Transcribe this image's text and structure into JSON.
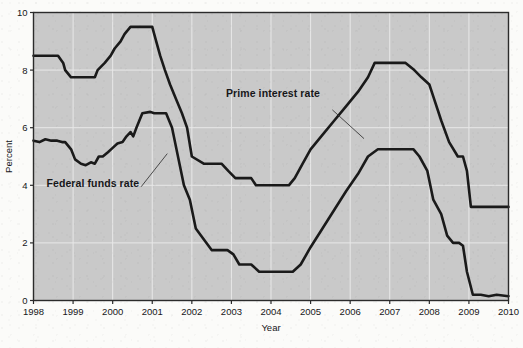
{
  "chart_data": {
    "type": "line",
    "title": "",
    "xlabel": "Year",
    "ylabel": "Percent",
    "xlim": [
      1998,
      2010
    ],
    "ylim": [
      0,
      10
    ],
    "xticks": [
      "1998",
      "1999",
      "2000",
      "2001",
      "2002",
      "2003",
      "2004",
      "2005",
      "2006",
      "2007",
      "2008",
      "2009",
      "2010"
    ],
    "yticks": [
      "0",
      "2",
      "4",
      "6",
      "8",
      "10"
    ],
    "grid": true,
    "legend_position": "inline-annotations",
    "plot_background": "#c9c9c9",
    "line_color": "#1a1a1a",
    "series": [
      {
        "name": "Prime interest rate",
        "label_x": 2004.05,
        "label_y": 7.05,
        "leader_from": [
          2005.55,
          6.62
        ],
        "leader_to": [
          2006.35,
          5.62
        ],
        "x": [
          1998.0,
          1998.25,
          1998.62,
          1998.75,
          1998.8,
          1998.95,
          1999.05,
          1999.35,
          1999.55,
          1999.62,
          1999.8,
          1999.95,
          2000.05,
          2000.2,
          2000.3,
          2000.45,
          2000.6,
          2000.72,
          2000.95,
          2001.0,
          2001.1,
          2001.2,
          2001.32,
          2001.45,
          2001.6,
          2001.75,
          2001.88,
          2002.0,
          2002.3,
          2002.75,
          2002.92,
          2003.1,
          2003.5,
          2003.62,
          2004.0,
          2004.45,
          2004.6,
          2004.8,
          2005.0,
          2005.3,
          2005.6,
          2005.9,
          2006.2,
          2006.45,
          2006.62,
          2007.4,
          2007.62,
          2007.8,
          2008.0,
          2008.12,
          2008.3,
          2008.5,
          2008.72,
          2008.85,
          2008.95,
          2009.05,
          2010.0
        ],
        "y": [
          8.5,
          8.5,
          8.5,
          8.25,
          8.0,
          7.75,
          7.75,
          7.75,
          7.75,
          8.0,
          8.25,
          8.5,
          8.75,
          9.0,
          9.25,
          9.5,
          9.5,
          9.5,
          9.5,
          9.5,
          9.0,
          8.5,
          8.0,
          7.5,
          7.0,
          6.5,
          6.0,
          5.0,
          4.75,
          4.75,
          4.5,
          4.25,
          4.25,
          4.0,
          4.0,
          4.0,
          4.25,
          4.75,
          5.25,
          5.75,
          6.25,
          6.75,
          7.25,
          7.75,
          8.25,
          8.25,
          8.0,
          7.75,
          7.5,
          7.0,
          6.25,
          5.5,
          5.0,
          5.0,
          4.5,
          3.25,
          3.25
        ]
      },
      {
        "name": "Federal funds rate",
        "label_x": 1999.5,
        "label_y": 3.95,
        "leader_from": [
          2000.72,
          3.95
        ],
        "leader_to": [
          2001.38,
          5.1
        ],
        "x": [
          1998.0,
          1998.15,
          1998.3,
          1998.45,
          1998.6,
          1998.72,
          1998.8,
          1998.95,
          1999.05,
          1999.2,
          1999.32,
          1999.45,
          1999.55,
          1999.65,
          1999.75,
          1999.88,
          2000.0,
          2000.12,
          2000.25,
          2000.35,
          2000.45,
          2000.52,
          2000.6,
          2000.75,
          2000.95,
          2001.05,
          2001.2,
          2001.35,
          2001.5,
          2001.65,
          2001.8,
          2001.95,
          2002.1,
          2002.5,
          2002.9,
          2003.05,
          2003.2,
          2003.5,
          2003.7,
          2004.0,
          2004.3,
          2004.55,
          2004.75,
          2005.0,
          2005.3,
          2005.6,
          2005.9,
          2006.2,
          2006.45,
          2006.7,
          2007.3,
          2007.6,
          2007.75,
          2007.95,
          2008.1,
          2008.3,
          2008.45,
          2008.6,
          2008.75,
          2008.85,
          2008.95,
          2009.1,
          2009.3,
          2009.5,
          2009.7,
          2010.0
        ],
        "y": [
          5.55,
          5.5,
          5.6,
          5.55,
          5.55,
          5.5,
          5.5,
          5.25,
          4.9,
          4.75,
          4.7,
          4.8,
          4.75,
          5.0,
          5.0,
          5.15,
          5.3,
          5.45,
          5.5,
          5.7,
          5.85,
          5.7,
          6.0,
          6.5,
          6.55,
          6.5,
          6.5,
          6.5,
          6.0,
          5.0,
          4.0,
          3.5,
          2.5,
          1.75,
          1.75,
          1.6,
          1.25,
          1.25,
          1.0,
          1.0,
          1.0,
          1.0,
          1.25,
          1.85,
          2.5,
          3.15,
          3.8,
          4.4,
          5.0,
          5.25,
          5.25,
          5.25,
          5.0,
          4.5,
          3.5,
          3.0,
          2.25,
          2.0,
          2.0,
          1.9,
          1.0,
          0.2,
          0.2,
          0.15,
          0.2,
          0.15
        ]
      }
    ]
  }
}
